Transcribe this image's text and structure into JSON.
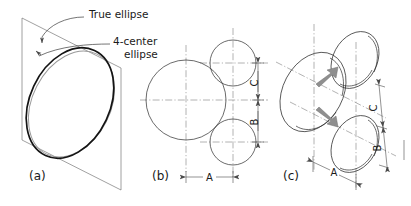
{
  "figure": {
    "background_color": "#ffffff",
    "ink_color": "#1a1a1a",
    "construction_color": "#6d6d6d",
    "arrow_color": "#8f8f8f"
  },
  "annotations": {
    "true_ellipse_label": "True ellipse",
    "four_center_label_line1": "4-center",
    "four_center_label_line2": "ellipse"
  },
  "panels": [
    {
      "key": "a",
      "label": "(a)",
      "caption": "True ellipse overlaid on 4-center approximate ellipse inside isometric rhombus"
    },
    {
      "key": "b",
      "label": "(b)",
      "caption": "Orthographic construction circles defining radii"
    },
    {
      "key": "c",
      "label": "(c)",
      "caption": "Isometric pictorial of the construction circles"
    }
  ],
  "dimensions": {
    "a": "A",
    "b": "B",
    "c": "C"
  },
  "panel_b_dimensions": [
    {
      "name": "A",
      "label": "A",
      "orientation": "horizontal"
    },
    {
      "name": "B",
      "label": "B",
      "orientation": "vertical"
    },
    {
      "name": "C",
      "label": "C",
      "orientation": "vertical"
    }
  ],
  "panel_c_dimensions": [
    {
      "name": "A",
      "label": "A",
      "orientation": "isometric-horizontal"
    },
    {
      "name": "B",
      "label": "B",
      "orientation": "isometric-vertical"
    },
    {
      "name": "C",
      "label": "C",
      "orientation": "isometric-vertical"
    }
  ],
  "panel_b_circles": [
    {
      "name": "large-circle",
      "cx": 186,
      "cy": 100,
      "r": 40
    },
    {
      "name": "upper-small-circle",
      "cx": 233,
      "cy": 63,
      "r": 23
    },
    {
      "name": "lower-small-circle",
      "cx": 233,
      "cy": 142,
      "r": 23
    }
  ],
  "panel_c_arrows": [
    {
      "name": "arrow-up-right",
      "direction": "up-right"
    },
    {
      "name": "arrow-down-right",
      "direction": "down-right"
    }
  ]
}
